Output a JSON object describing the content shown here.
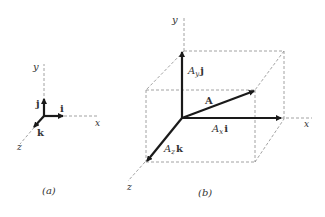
{
  "figure_a": {
    "caption": "(a)",
    "axes": {
      "x": "x",
      "y": "y",
      "z": "z"
    },
    "unit_vectors": {
      "i": "i",
      "j": "j",
      "k": "k"
    }
  },
  "figure_b": {
    "caption": "(b)",
    "axes": {
      "x": "x",
      "y": "y",
      "z": "z"
    },
    "vector": "A",
    "components": {
      "x": {
        "coef": "A",
        "sub": "x",
        "unit": "i"
      },
      "y": {
        "coef": "A",
        "sub": "y",
        "unit": "j"
      },
      "z": {
        "coef": "A",
        "sub": "z",
        "unit": "k"
      }
    }
  },
  "colors": {
    "ink": "#1a1a1a",
    "dashed": "#8a8a8a",
    "text": "#333333"
  }
}
